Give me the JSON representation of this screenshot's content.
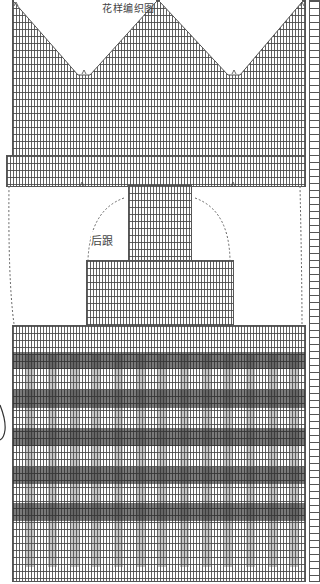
{
  "chart_title": "花样编织图",
  "heel_label": "后跟",
  "diagram": {
    "type": "knitting-chart",
    "sections": [
      {
        "name": "toe",
        "shape": "double V-point decrease",
        "y_range": [
          0,
          155
        ]
      },
      {
        "name": "foot-body",
        "y_range": [
          155,
          185
        ]
      },
      {
        "name": "heel-region",
        "label": "后跟",
        "y_range": [
          185,
          325
        ]
      },
      {
        "name": "leg-cuff",
        "y_range": [
          325,
          580
        ],
        "dark_bands": 5
      }
    ],
    "colors": {
      "grid_line": "#555555",
      "dark_band": "#5a5a5a",
      "background": "#ffffff"
    }
  },
  "bottom_numbers": [
    "35",
    "30",
    "25",
    "20",
    "15",
    "10",
    "5",
    "1"
  ]
}
